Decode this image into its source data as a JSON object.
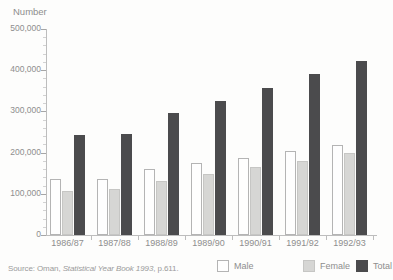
{
  "source_note": {
    "prefix": "Source: Oman, ",
    "italic": "Statistical Year Book 1993",
    "suffix": ", p.611."
  },
  "legend": {
    "position": "bottom-right",
    "items": [
      {
        "label": "Male",
        "fill": "#fefefe",
        "border": "#b4b4b4"
      },
      {
        "label": "Female",
        "fill": "#d6d6d4",
        "border": "#c6c6c4"
      },
      {
        "label": "Total",
        "fill": "#4b4b4d",
        "border": "#4b4b4d"
      }
    ]
  },
  "chart_data": {
    "type": "bar",
    "title": "Number",
    "ylabel": "Number",
    "xlabel": "",
    "categories": [
      "1986/87",
      "1987/88",
      "1988/89",
      "1989/90",
      "1990/91",
      "1991/92",
      "1992/93"
    ],
    "series": [
      {
        "name": "Male",
        "values": [
          137000,
          136000,
          160000,
          175000,
          188000,
          204000,
          218000
        ]
      },
      {
        "name": "Female",
        "values": [
          106000,
          111000,
          131000,
          147000,
          165000,
          180000,
          199000
        ]
      },
      {
        "name": "Total",
        "values": [
          243000,
          245000,
          297000,
          325000,
          357000,
          391000,
          422000
        ]
      }
    ],
    "ylim": [
      0,
      500000
    ],
    "ytick_interval": 100000,
    "ytick_labels": [
      "0",
      "100,000",
      "200,000",
      "300,000",
      "400,000",
      "500,000"
    ],
    "minor_tick_interval": 20000,
    "grid": false,
    "legend_position": "bottom-right",
    "source": "Source: Oman, Statistical Year Book 1993, p.611."
  },
  "colors": {
    "text": "#8e8e8e",
    "axis": "#bdbdbd",
    "background": "#fdfdfc"
  }
}
